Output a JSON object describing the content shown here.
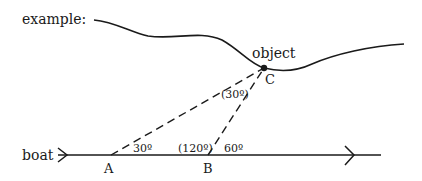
{
  "diagram": {
    "title_label": "example:",
    "object_label": "object",
    "boat_label": "boat",
    "points": {
      "A": {
        "label": "A",
        "x": 111,
        "y": 155
      },
      "B": {
        "label": "B",
        "x": 208,
        "y": 155
      },
      "C": {
        "label": "C",
        "x": 264,
        "y": 68
      }
    },
    "angles": {
      "at_A": "30º",
      "at_B_interior": "(120º)",
      "at_B_exterior": "60º",
      "at_C": "(30º)"
    },
    "colors": {
      "stroke": "#1a1a1a",
      "background": "#ffffff"
    }
  }
}
